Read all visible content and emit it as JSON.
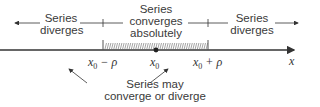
{
  "diagram": {
    "regions": {
      "left": {
        "line1": "Series",
        "line2": "diverges"
      },
      "center": {
        "line1": "Series",
        "line2": "converges",
        "line3": "absolutely"
      },
      "right": {
        "line1": "Series",
        "line2": "diverges"
      }
    },
    "ticks": {
      "left": {
        "base": "x",
        "sub": "0",
        "suffix": " − ρ"
      },
      "center": {
        "base": "x",
        "sub": "0"
      },
      "right": {
        "base": "x",
        "sub": "0",
        "suffix": " + ρ"
      }
    },
    "axis_label": "x",
    "bottom_note": {
      "line1": "Series may",
      "line2": "converge or diverge"
    },
    "colors": {
      "line": "#333333",
      "text": "#3a3a3a",
      "hatch": "#555555"
    }
  }
}
